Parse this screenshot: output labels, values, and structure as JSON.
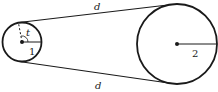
{
  "diagram": {
    "type": "belt-pulley",
    "small_pulley": {
      "label": "1",
      "angle_label": "t"
    },
    "large_pulley": {
      "label": "2"
    },
    "belt_segments": [
      {
        "label": "d"
      },
      {
        "label": "d"
      }
    ],
    "stroke_color": "#1a1a1a"
  }
}
